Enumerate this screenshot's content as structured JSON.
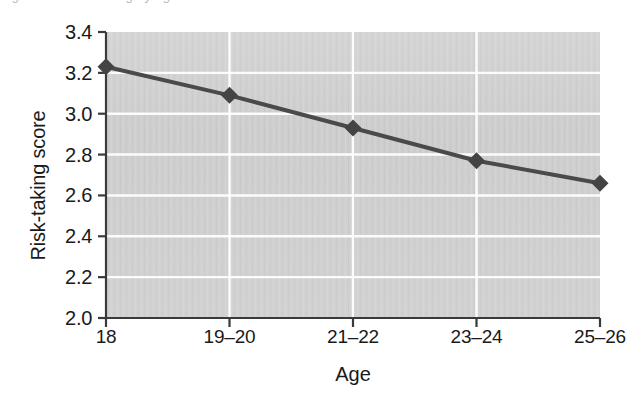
{
  "figure": {
    "caption_sliver": "Figure 9.4 Risk-taking by age",
    "background_color": "#ffffff"
  },
  "chart_data": {
    "type": "line",
    "title": "",
    "subtitle": "",
    "xlabel": "Age",
    "ylabel": "Risk-taking score",
    "categories": [
      "18",
      "19–20",
      "21–22",
      "23–24",
      "25–26"
    ],
    "values": [
      3.23,
      3.09,
      2.93,
      2.77,
      2.66
    ],
    "series": [
      {
        "name": "Risk-taking score",
        "values": [
          3.23,
          3.09,
          2.93,
          2.77,
          2.66
        ]
      }
    ],
    "ylim": [
      2.0,
      3.4
    ],
    "ytick_labels": [
      "2.0",
      "2.2",
      "2.4",
      "2.6",
      "2.8",
      "3.0",
      "3.2",
      "3.4"
    ],
    "ytick_values": [
      2.0,
      2.2,
      2.4,
      2.6,
      2.8,
      3.0,
      3.2,
      3.4
    ],
    "ytick_step": 0.2,
    "grid": "horizontal-and-vertical",
    "gridline_color": "#ffffff",
    "plot_background_color": "#cdcdcd",
    "legend": "none",
    "legend_position": "none",
    "marker": "diamond",
    "line_color": "#4a4a4a",
    "marker_color": "#444444",
    "axis_color": "#3a3a3a",
    "line_width": 4
  }
}
